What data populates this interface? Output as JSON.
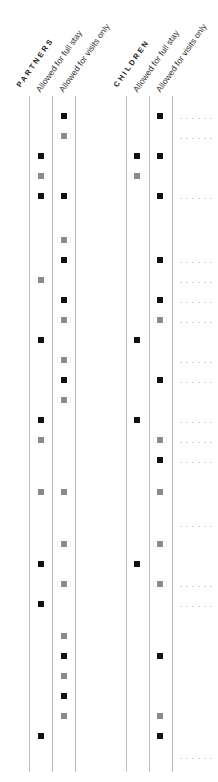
{
  "chart_data": {
    "type": "table",
    "title": "",
    "groups": [
      {
        "name": "PARTNERS",
        "columns": [
          "Allowed for full stay",
          "Allowed for visits only"
        ]
      },
      {
        "name": "CHILDREN",
        "columns": [
          "Allowed for full stay",
          "Allowed for visits only"
        ]
      }
    ],
    "legend": {
      "black": "#111111",
      "gray": "#8a8a8a"
    },
    "rows": [
      {
        "y": 116,
        "pf": null,
        "pv": "black",
        "cf": null,
        "cv": "black",
        "leader": true
      },
      {
        "y": 136,
        "pf": null,
        "pv": "gray",
        "cf": null,
        "cv": null,
        "leader": true
      },
      {
        "y": 156,
        "pf": "black",
        "pv": null,
        "cf": "black",
        "cv": "black",
        "leader": false
      },
      {
        "y": 176,
        "pf": "gray",
        "pv": null,
        "cf": "gray",
        "cv": null,
        "leader": false
      },
      {
        "y": 196,
        "pf": "black",
        "pv": "black",
        "cf": null,
        "cv": "black",
        "leader": true
      },
      {
        "y": 240,
        "pf": null,
        "pv": "gray",
        "cf": null,
        "cv": null,
        "leader": false
      },
      {
        "y": 260,
        "pf": null,
        "pv": "black",
        "cf": null,
        "cv": "black",
        "leader": true
      },
      {
        "y": 280,
        "pf": "gray",
        "pv": null,
        "cf": null,
        "cv": null,
        "leader": true
      },
      {
        "y": 300,
        "pf": null,
        "pv": "black",
        "cf": null,
        "cv": "black",
        "leader": true
      },
      {
        "y": 320,
        "pf": null,
        "pv": "gray",
        "cf": null,
        "cv": "gray",
        "leader": true
      },
      {
        "y": 340,
        "pf": "black",
        "pv": null,
        "cf": "black",
        "cv": null,
        "leader": false
      },
      {
        "y": 360,
        "pf": null,
        "pv": "gray",
        "cf": null,
        "cv": null,
        "leader": true
      },
      {
        "y": 380,
        "pf": null,
        "pv": "black",
        "cf": null,
        "cv": "black",
        "leader": true
      },
      {
        "y": 400,
        "pf": null,
        "pv": "gray",
        "cf": null,
        "cv": null,
        "leader": false
      },
      {
        "y": 420,
        "pf": "black",
        "pv": null,
        "cf": "black",
        "cv": null,
        "leader": true
      },
      {
        "y": 440,
        "pf": "gray",
        "pv": null,
        "cf": null,
        "cv": "gray",
        "leader": true
      },
      {
        "y": 460,
        "pf": null,
        "pv": null,
        "cf": null,
        "cv": "black",
        "leader": true
      },
      {
        "y": 492,
        "pf": "gray",
        "pv": "gray",
        "cf": null,
        "cv": "gray",
        "leader": false
      },
      {
        "y": 524,
        "pf": null,
        "pv": null,
        "cf": null,
        "cv": null,
        "leader": true
      },
      {
        "y": 544,
        "pf": null,
        "pv": "gray",
        "cf": null,
        "cv": "gray",
        "leader": false
      },
      {
        "y": 564,
        "pf": "black",
        "pv": null,
        "cf": "black",
        "cv": null,
        "leader": false
      },
      {
        "y": 584,
        "pf": null,
        "pv": "gray",
        "cf": null,
        "cv": "gray",
        "leader": true
      },
      {
        "y": 604,
        "pf": "black",
        "pv": null,
        "cf": null,
        "cv": null,
        "leader": true
      },
      {
        "y": 636,
        "pf": null,
        "pv": "gray",
        "cf": null,
        "cv": null,
        "leader": false
      },
      {
        "y": 656,
        "pf": null,
        "pv": "black",
        "cf": null,
        "cv": "black",
        "leader": false
      },
      {
        "y": 676,
        "pf": null,
        "pv": "gray",
        "cf": null,
        "cv": null,
        "leader": false
      },
      {
        "y": 696,
        "pf": null,
        "pv": "black",
        "cf": null,
        "cv": null,
        "leader": false
      },
      {
        "y": 716,
        "pf": null,
        "pv": "gray",
        "cf": null,
        "cv": "gray",
        "leader": false
      },
      {
        "y": 736,
        "pf": "black",
        "pv": null,
        "cf": null,
        "cv": "black",
        "leader": false
      },
      {
        "y": 756,
        "pf": null,
        "pv": null,
        "cf": null,
        "cv": null,
        "leader": true
      }
    ]
  },
  "headers": {
    "partners": {
      "group": "PARTNERS",
      "full": "Allowed for full stay",
      "visits": "Allowed for visits only"
    },
    "children": {
      "group": "CHILDREN",
      "full": "Allowed for full stay",
      "visits": "Allowed for visits only"
    }
  }
}
